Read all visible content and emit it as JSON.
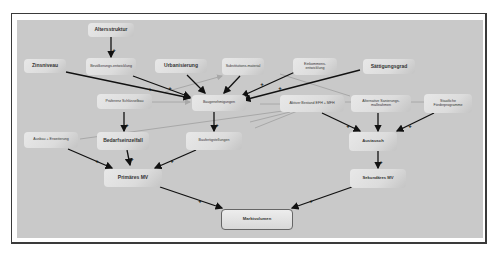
{
  "diagram": {
    "title": "",
    "colors": {
      "frame_border": "#3a3a3a",
      "panel_bg": "#c9c9c9",
      "node_bg": "#dcdcdc",
      "edge_dark": "#111111",
      "edge_light": "#a8a8a8"
    },
    "nodes": {
      "altersstruktur": "Altersstruktur",
      "zinsniveau": "Zinsniveau",
      "bevoelkerungsentwicklung": "Bevölkerungs-entwicklung",
      "urbanisierung": "Urbanisierung",
      "substitutionsmaterial": "Substitutions-material",
      "einkommensentwicklung": "Einkommens-entwicklung",
      "saettigungsgrad": "Sättigungsgrad",
      "praeferenz_schluesselbau": "Präferenz Schlüsselbau",
      "baugenehmigungen": "Baugenehmigungen",
      "aktiver_bestand": "Aktiver Bestand EFH + MFH",
      "alternative_sanierungsmassnahmen": "Alternative Sanierungs-maßnahmen",
      "staatliche_foerderprogramme": "Staatliche Förderprogramme",
      "ausbau_erweiterung": "Ausbau + Erweiterung",
      "bedarfseinzelfall": "Bedarfseinzelfall",
      "baufertigstellungen": "Baufertigstellungen",
      "austausch": "Austausch",
      "primaeres_mv": "Primäres MV",
      "sekundaeres_mv": "Sekundäres MV",
      "marktvolumen": "Marktvolumen"
    },
    "edge_sign": "+",
    "edges": [
      {
        "from": "Altersstruktur",
        "to": "Bevölkerungs-entwicklung",
        "sign": "+",
        "style": "dark"
      },
      {
        "from": "Zinsniveau",
        "to": "Baugenehmigungen",
        "sign": "+",
        "style": "dark"
      },
      {
        "from": "Bevölkerungs-entwicklung",
        "to": "Baugenehmigungen",
        "sign": "+",
        "style": "dark"
      },
      {
        "from": "Urbanisierung",
        "to": "Baugenehmigungen",
        "sign": "+",
        "style": "dark"
      },
      {
        "from": "Substitutions-material",
        "to": "Baugenehmigungen",
        "sign": "+",
        "style": "dark"
      },
      {
        "from": "Einkommens-entwicklung",
        "to": "Baugenehmigungen",
        "sign": "+",
        "style": "dark"
      },
      {
        "from": "Sättigungsgrad",
        "to": "Baugenehmigungen",
        "sign": "+",
        "style": "dark"
      },
      {
        "from": "Präferenz Schlüsselbau",
        "to": "Baugenehmigungen",
        "sign": "+",
        "style": "light"
      },
      {
        "from": "Präferenz Schlüsselbau",
        "to": "Bedarfseinzelfall",
        "sign": "+",
        "style": "dark"
      },
      {
        "from": "Baugenehmigungen",
        "to": "Baufertigstellungen",
        "sign": "+",
        "style": "dark"
      },
      {
        "from": "Aktiver Bestand EFH + MFH",
        "to": "Austausch",
        "sign": "+",
        "style": "dark"
      },
      {
        "from": "Alternative Sanierungs-maßnahmen",
        "to": "Austausch",
        "sign": "-",
        "style": "dark"
      },
      {
        "from": "Staatliche Förderprogramme",
        "to": "Austausch",
        "sign": "+",
        "style": "dark"
      },
      {
        "from": "Ausbau + Erweiterung",
        "to": "Primäres MV",
        "sign": "+",
        "style": "dark"
      },
      {
        "from": "Bedarfseinzelfall",
        "to": "Primäres MV",
        "sign": "+",
        "style": "dark"
      },
      {
        "from": "Baufertigstellungen",
        "to": "Primäres MV",
        "sign": "+",
        "style": "dark"
      },
      {
        "from": "Austausch",
        "to": "Sekundäres MV",
        "sign": "+",
        "style": "dark"
      },
      {
        "from": "Primäres MV",
        "to": "Marktvolumen",
        "sign": "+",
        "style": "dark"
      },
      {
        "from": "Sekundäres MV",
        "to": "Marktvolumen",
        "sign": "+",
        "style": "dark"
      }
    ]
  }
}
